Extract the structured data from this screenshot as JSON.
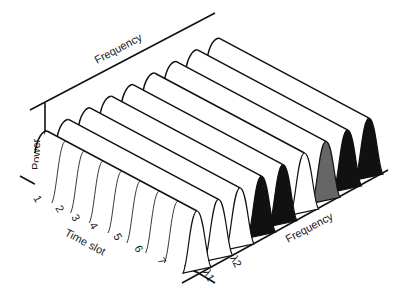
{
  "figure": {
    "type": "3d-waterfall",
    "axes": {
      "power_label": "Power",
      "time_label": "Time slot",
      "back_frequency_label": "Frequency",
      "front_frequency_label": "Frequency"
    },
    "time_slots": [
      "1",
      "2",
      "3",
      "4",
      "5",
      "6",
      "7"
    ],
    "wavelength_labels": [
      "λ1",
      "λ2"
    ],
    "channels": [
      {
        "index": 1,
        "fill": "#ffffff"
      },
      {
        "index": 2,
        "fill": "#ffffff"
      },
      {
        "index": 3,
        "fill": "#ffffff"
      },
      {
        "index": 4,
        "fill": "#111111"
      },
      {
        "index": 5,
        "fill": "#111111"
      },
      {
        "index": 6,
        "fill": "#ffffff"
      },
      {
        "index": 7,
        "fill": "#666666"
      },
      {
        "index": 8,
        "fill": "#111111"
      },
      {
        "index": 9,
        "fill": "#111111"
      }
    ],
    "colors": {
      "ink": "#111111",
      "gray_fill": "#666666",
      "background": "#ffffff"
    }
  }
}
